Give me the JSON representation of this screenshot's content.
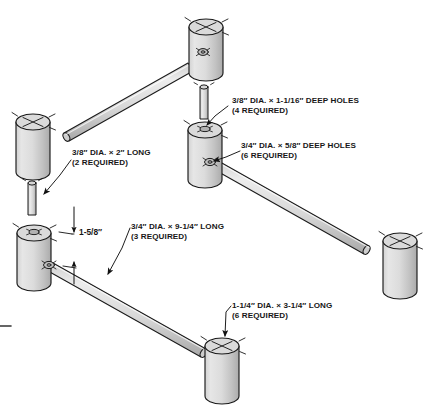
{
  "figure": {
    "type": "isometric-assembly-diagram",
    "background_color": "#ffffff",
    "line_color": "#1a1a1a",
    "part_fill_light": "#e2e2e2",
    "part_fill_mid": "#cfcfcf",
    "part_fill_shadow": "#b4b4b4",
    "top_face_fill": "#d9d9d9"
  },
  "callouts": [
    {
      "id": "deep-holes-38",
      "line1": "3/8″ DIA. × 1-1/16″ DEEP HOLES",
      "line2": "(4 REQUIRED)"
    },
    {
      "id": "deep-holes-34",
      "line1": "3/4″ DIA. × 5/8″ DEEP HOLES",
      "line2": "(6 REQUIRED)"
    },
    {
      "id": "dowel-38-long",
      "line1": "3/8″ DIA. × 2″ LONG",
      "line2": "(2 REQUIRED)"
    },
    {
      "id": "dowel-34-long",
      "line1": "3/4″ DIA. × 9-1/4″ LONG",
      "line2": "(3 REQUIRED)"
    },
    {
      "id": "post-114-long",
      "line1": "1-1/4″ DIA. × 3-1/4″ LONG",
      "line2": "(6 REQUIRED)"
    }
  ],
  "dimensions": [
    {
      "id": "spacing",
      "value": "1-5/8″"
    }
  ],
  "parts": [
    {
      "id": "post-top",
      "name": "upper post",
      "label": "1-1/4″ DIA. × 3-1/4″ LONG"
    },
    {
      "id": "post-mid-right",
      "name": "middle right post",
      "label": "1-1/4″ DIA. × 3-1/4″ LONG"
    },
    {
      "id": "post-left-upper",
      "name": "upper left post",
      "label": "1-1/4″ DIA. × 3-1/4″ LONG"
    },
    {
      "id": "post-left-lower",
      "name": "lower left post",
      "label": "1-1/4″ DIA. × 3-1/4″ LONG"
    },
    {
      "id": "post-right",
      "name": "right post",
      "label": "1-1/4″ DIA. × 3-1/4″ LONG"
    },
    {
      "id": "post-bottom",
      "name": "bottom post",
      "label": "1-1/4″ DIA. × 3-1/4″ LONG"
    },
    {
      "id": "dowel-upper-left",
      "name": "upper left stretcher",
      "label": "3/4″ DIA. × 9-1/4″ LONG"
    },
    {
      "id": "dowel-right",
      "name": "right stretcher",
      "label": "3/4″ DIA. × 9-1/4″ LONG"
    },
    {
      "id": "dowel-lower-left",
      "name": "lower left stretcher",
      "label": "3/4″ DIA. × 9-1/4″ LONG"
    },
    {
      "id": "peg-top",
      "name": "top peg",
      "label": "3/8″ DIA. × 2″ LONG"
    },
    {
      "id": "peg-left",
      "name": "left peg",
      "label": "3/8″ DIA. × 2″ LONG"
    }
  ]
}
